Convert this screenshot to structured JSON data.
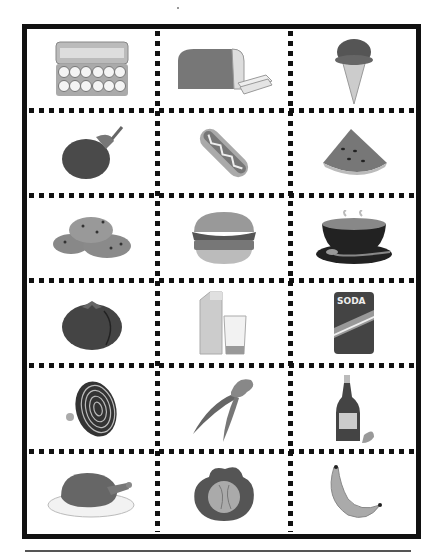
{
  "worksheet": {
    "grid": {
      "columns": 3,
      "rows": 6
    },
    "cards": [
      {
        "name": "egg-carton",
        "label": "Eggs"
      },
      {
        "name": "bread-loaf",
        "label": "Bread"
      },
      {
        "name": "ice-cream-cone",
        "label": "Ice cream"
      },
      {
        "name": "eggplant",
        "label": "Eggplant"
      },
      {
        "name": "hot-dog",
        "label": "Hot dog"
      },
      {
        "name": "watermelon-slice",
        "label": "Watermelon"
      },
      {
        "name": "cookies",
        "label": "Cookies"
      },
      {
        "name": "hamburger",
        "label": "Hamburger"
      },
      {
        "name": "soup-bowl",
        "label": "Soup"
      },
      {
        "name": "tomato",
        "label": "Tomato"
      },
      {
        "name": "milk-carton-and-glass",
        "label": "Milk"
      },
      {
        "name": "soda-can",
        "label": "Soda",
        "text": "SODA"
      },
      {
        "name": "onion-half",
        "label": "Onion"
      },
      {
        "name": "carrots",
        "label": "Carrots"
      },
      {
        "name": "ketchup-bottle",
        "label": "Ketchup"
      },
      {
        "name": "roast-turkey",
        "label": "Turkey"
      },
      {
        "name": "cabbage",
        "label": "Cabbage"
      },
      {
        "name": "banana",
        "label": "Banana"
      }
    ],
    "colors": {
      "ink": "#111111",
      "paper": "#ffffff",
      "rule": "#555555"
    }
  }
}
